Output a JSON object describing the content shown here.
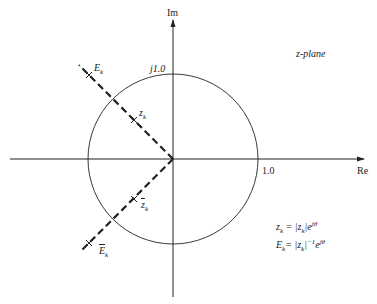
{
  "diagram": {
    "type": "complex-plane",
    "plane_label": "z-plane",
    "axes": {
      "real_label": "Re",
      "imag_label": "Im"
    },
    "unit_circle": {
      "real_tick": "1.0",
      "imag_tick": "j1.0"
    },
    "points": [
      {
        "id": "E_k",
        "base": "E",
        "sub": "k",
        "conjugate": false
      },
      {
        "id": "z_k",
        "base": "z",
        "sub": "k",
        "conjugate": false
      },
      {
        "id": "z_k_conj",
        "base": "z",
        "sub": "k",
        "conjugate": true
      },
      {
        "id": "E_k_conj",
        "base": "E",
        "sub": "k",
        "conjugate": true
      }
    ],
    "equations": [
      {
        "lhs": "z",
        "lhs_sub": "k",
        "rhs_text": "= |z",
        "rhs_sub": "k",
        "rhs_tail": "|e",
        "exp": "jθ"
      },
      {
        "lhs": "E",
        "lhs_sub": "k",
        "rhs_text": "= |z",
        "rhs_sub": "k",
        "rhs_tail": "|",
        "pow": "−1",
        "tail2": "e",
        "exp": "jθ"
      }
    ],
    "colors": {
      "stroke": "#222222",
      "background": "#ffffff"
    }
  }
}
